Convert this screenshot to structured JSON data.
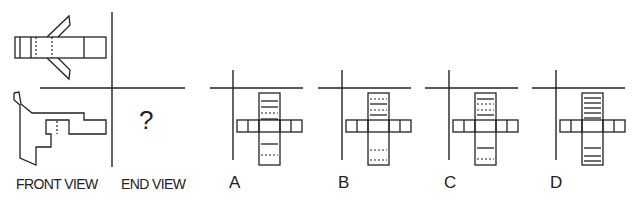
{
  "top_label": "TOP VIEW",
  "views": {
    "front": "FRONT VIEW",
    "end": "END VIEW",
    "end_placeholder": "?"
  },
  "options": [
    {
      "letter": "A",
      "column_lines": [
        {
          "y": 8,
          "style": "solid"
        },
        {
          "y": 14,
          "style": "solid"
        },
        {
          "y": 20,
          "style": "dashed"
        },
        {
          "y": 26,
          "style": "solid"
        },
        {
          "y": 51,
          "style": "solid"
        },
        {
          "y": 62,
          "style": "dashed"
        }
      ],
      "bar_lines": [
        12,
        54
      ]
    },
    {
      "letter": "B",
      "column_lines": [
        {
          "y": 6,
          "style": "dashed"
        },
        {
          "y": 11,
          "style": "solid"
        },
        {
          "y": 17,
          "style": "dashed"
        },
        {
          "y": 22,
          "style": "solid"
        },
        {
          "y": 57,
          "style": "dashed"
        },
        {
          "y": 67,
          "style": "dashed"
        }
      ],
      "bar_lines": [
        12,
        54
      ]
    },
    {
      "letter": "C",
      "column_lines": [
        {
          "y": 6,
          "style": "solid"
        },
        {
          "y": 11,
          "style": "dashed"
        },
        {
          "y": 17,
          "style": "dashed"
        },
        {
          "y": 22,
          "style": "solid"
        },
        {
          "y": 55,
          "style": "solid"
        },
        {
          "y": 66,
          "style": "dashed"
        }
      ],
      "bar_lines": [
        12,
        54
      ]
    },
    {
      "letter": "D",
      "column_lines": [
        {
          "y": 5,
          "style": "solid"
        },
        {
          "y": 10,
          "style": "solid"
        },
        {
          "y": 15,
          "style": "solid"
        },
        {
          "y": 20,
          "style": "solid"
        },
        {
          "y": 25,
          "style": "solid"
        },
        {
          "y": 55,
          "style": "solid"
        },
        {
          "y": 63,
          "style": "solid"
        },
        {
          "y": 68,
          "style": "solid"
        }
      ],
      "bar_lines": [
        12,
        54
      ]
    }
  ]
}
